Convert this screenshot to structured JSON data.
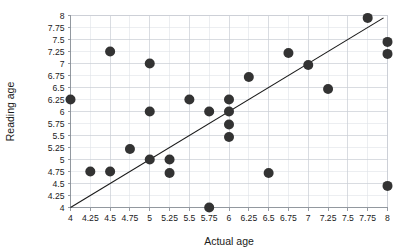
{
  "chart_data": {
    "type": "scatter",
    "title": "",
    "xlabel": "Actual age",
    "ylabel": "Reading age",
    "xlim": [
      4,
      8
    ],
    "ylim": [
      4,
      8
    ],
    "xticks": [
      "4",
      "4.25",
      "4.5",
      "4.75",
      "5",
      "5.25",
      "5.5",
      "5.75",
      "6",
      "6.25",
      "6.5",
      "6.75",
      "7",
      "7.25",
      "7.5",
      "7.75",
      "8"
    ],
    "yticks": [
      "4",
      "4.25",
      "4.5",
      "4.75",
      "5",
      "5.25",
      "5.5",
      "5.75",
      "6",
      "6.25",
      "6.5",
      "6.75",
      "7",
      "7.25",
      "7.5",
      "7.75",
      "8"
    ],
    "xtick_values": [
      4,
      4.25,
      4.5,
      4.75,
      5,
      5.25,
      5.5,
      5.75,
      6,
      6.25,
      6.5,
      6.75,
      7,
      7.25,
      7.5,
      7.75,
      8
    ],
    "ytick_values": [
      4,
      4.25,
      4.5,
      4.75,
      5,
      5.25,
      5.5,
      5.75,
      6,
      6.25,
      6.5,
      6.75,
      7,
      7.25,
      7.5,
      7.75,
      8
    ],
    "grid": true,
    "legend": "none",
    "marker_color": "#333333",
    "marker_size": 5,
    "points": [
      {
        "x": 4.0,
        "y": 6.25
      },
      {
        "x": 4.25,
        "y": 4.75
      },
      {
        "x": 4.5,
        "y": 7.25
      },
      {
        "x": 4.5,
        "y": 4.75
      },
      {
        "x": 4.75,
        "y": 5.22
      },
      {
        "x": 5.0,
        "y": 7.0
      },
      {
        "x": 5.0,
        "y": 6.0
      },
      {
        "x": 5.0,
        "y": 5.0
      },
      {
        "x": 5.25,
        "y": 5.0
      },
      {
        "x": 5.25,
        "y": 4.72
      },
      {
        "x": 5.5,
        "y": 6.25
      },
      {
        "x": 5.75,
        "y": 6.0
      },
      {
        "x": 5.75,
        "y": 4.0
      },
      {
        "x": 6.0,
        "y": 6.25
      },
      {
        "x": 6.0,
        "y": 6.0
      },
      {
        "x": 6.0,
        "y": 5.73
      },
      {
        "x": 6.0,
        "y": 5.47
      },
      {
        "x": 6.25,
        "y": 6.72
      },
      {
        "x": 6.5,
        "y": 4.72
      },
      {
        "x": 6.75,
        "y": 7.22
      },
      {
        "x": 7.0,
        "y": 6.97
      },
      {
        "x": 7.25,
        "y": 6.47
      },
      {
        "x": 7.75,
        "y": 7.95
      },
      {
        "x": 8.0,
        "y": 7.45
      },
      {
        "x": 8.0,
        "y": 7.2
      },
      {
        "x": 8.0,
        "y": 4.45
      }
    ],
    "trendline": {
      "x1": 4.0,
      "y1": 4.0,
      "x2": 7.95,
      "y2": 7.95,
      "color": "#1a1a1a"
    }
  }
}
